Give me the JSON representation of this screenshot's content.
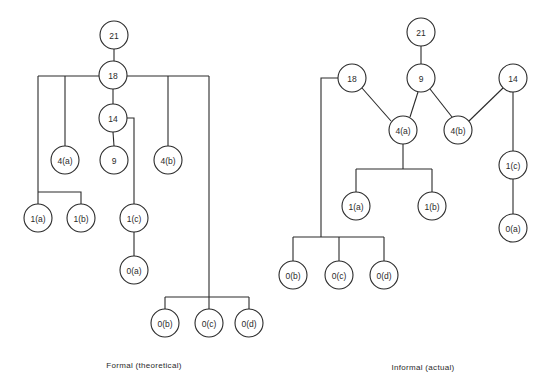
{
  "diagrams": [
    {
      "id": "formal",
      "caption": "Formal (theoretical)",
      "caption_pos": [
        144,
        361
      ],
      "nodes": [
        {
          "id": "f21",
          "label": "21",
          "x": 114,
          "y": 35
        },
        {
          "id": "f18",
          "label": "18",
          "x": 113,
          "y": 75
        },
        {
          "id": "f14",
          "label": "14",
          "x": 113,
          "y": 118
        },
        {
          "id": "f4a",
          "label": "4(a)",
          "x": 65,
          "y": 160
        },
        {
          "id": "f9",
          "label": "9",
          "x": 114,
          "y": 160
        },
        {
          "id": "f4b",
          "label": "4(b)",
          "x": 168,
          "y": 160
        },
        {
          "id": "f1a",
          "label": "1(a)",
          "x": 38,
          "y": 218
        },
        {
          "id": "f1b",
          "label": "1(b)",
          "x": 81,
          "y": 218
        },
        {
          "id": "f1c",
          "label": "1(c)",
          "x": 134,
          "y": 218
        },
        {
          "id": "f0a",
          "label": "0(a)",
          "x": 134,
          "y": 270
        },
        {
          "id": "f0b",
          "label": "0(b)",
          "x": 165,
          "y": 323
        },
        {
          "id": "f0c",
          "label": "0(c)",
          "x": 209,
          "y": 323
        },
        {
          "id": "f0d",
          "label": "0(d)",
          "x": 249,
          "y": 323
        }
      ],
      "edges": [
        "114,49 114,61",
        "38,76 99,76",
        "127,76 209,76",
        "65,76 65,146",
        "168,76 168,146",
        "113,89 113,104",
        "113,132 114,146",
        "127,118 134,118 134,204",
        "134,232 134,256",
        "38,76 38,204",
        "38,192 81,192 81,204",
        "209,76 209,309",
        "165,297 249,297",
        "165,297 165,309",
        "249,297 249,309"
      ]
    },
    {
      "id": "informal",
      "caption": "Informal (actual)",
      "caption_pos": [
        423,
        363
      ],
      "nodes": [
        {
          "id": "i21",
          "label": "21",
          "x": 421,
          "y": 32
        },
        {
          "id": "i18",
          "label": "18",
          "x": 352,
          "y": 78
        },
        {
          "id": "i9",
          "label": "9",
          "x": 421,
          "y": 78
        },
        {
          "id": "i14",
          "label": "14",
          "x": 513,
          "y": 78
        },
        {
          "id": "i4a",
          "label": "4(a)",
          "x": 403,
          "y": 130
        },
        {
          "id": "i4b",
          "label": "4(b)",
          "x": 458,
          "y": 130
        },
        {
          "id": "i1c",
          "label": "1(c)",
          "x": 513,
          "y": 165
        },
        {
          "id": "i1a",
          "label": "1(a)",
          "x": 356,
          "y": 206
        },
        {
          "id": "i1b",
          "label": "1(b)",
          "x": 432,
          "y": 206
        },
        {
          "id": "i0a",
          "label": "0(a)",
          "x": 513,
          "y": 228
        },
        {
          "id": "i0b",
          "label": "0(b)",
          "x": 293,
          "y": 275
        },
        {
          "id": "i0c",
          "label": "0(c)",
          "x": 339,
          "y": 275
        },
        {
          "id": "i0d",
          "label": "0(d)",
          "x": 384,
          "y": 275
        }
      ],
      "edges": [
        "421,46 421,64",
        "362,88 391,121",
        "418,92 410,117",
        "430,89 452,117",
        "503,88 469,121",
        "513,92 513,151",
        "513,179 513,214",
        "403,144 403,169",
        "356,169 432,169",
        "356,169 356,192",
        "432,169 432,192",
        "338,78 321,78 321,237",
        "293,237 384,237",
        "293,237 293,261",
        "339,237 339,261",
        "384,237 384,261"
      ]
    }
  ],
  "node_radius": 14,
  "colors": {
    "stroke": "#2a2a2a",
    "background": "#ffffff"
  }
}
